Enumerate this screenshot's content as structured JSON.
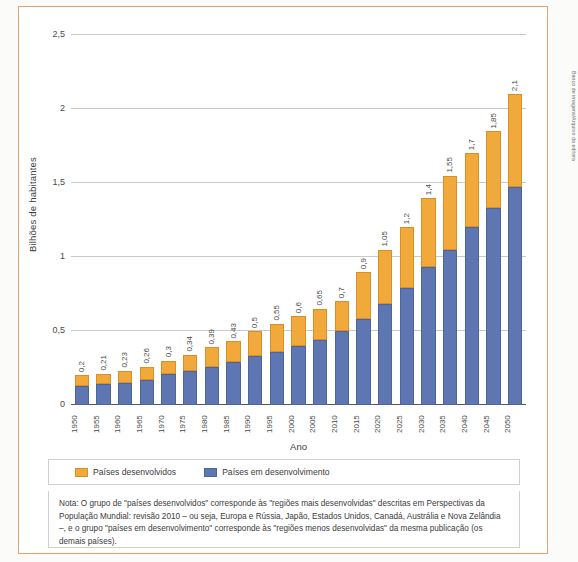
{
  "credit": "Banco de imagens/Arquivo da editora",
  "chart_data": {
    "type": "bar",
    "subtype": "stacked",
    "title": "",
    "xlabel": "Ano",
    "ylabel": "Bilhões de habitantes",
    "ylim": [
      0,
      2.5
    ],
    "yticks": [
      0,
      0.5,
      1,
      1.5,
      2,
      2.5
    ],
    "ytick_labels": [
      "0",
      "0,5",
      "1",
      "1,5",
      "2",
      "2,5"
    ],
    "grid": true,
    "legend_position": "bottom",
    "categories": [
      "1950",
      "1955",
      "1960",
      "1965",
      "1970",
      "1975",
      "1980",
      "1985",
      "1990",
      "1995",
      "2000",
      "2005",
      "2010",
      "2015",
      "2020",
      "2025",
      "2030",
      "2035",
      "2040",
      "2045",
      "2050"
    ],
    "series": [
      {
        "name": "Países em desenvolvimento",
        "color": "#5e77b3",
        "values": [
          0.13,
          0.14,
          0.15,
          0.17,
          0.21,
          0.23,
          0.26,
          0.29,
          0.33,
          0.36,
          0.4,
          0.44,
          0.5,
          0.58,
          0.68,
          0.79,
          0.93,
          1.05,
          1.2,
          1.33,
          1.47
        ]
      },
      {
        "name": "Países desenvolvidos",
        "color": "#f2a93b",
        "values": [
          0.07,
          0.07,
          0.08,
          0.09,
          0.09,
          0.11,
          0.13,
          0.14,
          0.17,
          0.19,
          0.2,
          0.21,
          0.2,
          0.32,
          0.37,
          0.41,
          0.47,
          0.5,
          0.5,
          0.52,
          0.63
        ]
      }
    ],
    "totals": [
      0.2,
      0.21,
      0.23,
      0.26,
      0.3,
      0.34,
      0.39,
      0.43,
      0.5,
      0.55,
      0.6,
      0.65,
      0.7,
      0.9,
      1.05,
      1.2,
      1.4,
      1.55,
      1.7,
      1.85,
      2.1
    ],
    "total_labels": [
      "0,2",
      "0,21",
      "0,23",
      "0,26",
      "0,3",
      "0,34",
      "0,39",
      "0,43",
      "0,5",
      "0,55",
      "0,6",
      "0,65",
      "0,7",
      "0,9",
      "1,05",
      "1,2",
      "1,4",
      "1,55",
      "1,7",
      "1,85",
      "2,1"
    ]
  },
  "legend": {
    "items": [
      {
        "label": "Países desenvolvidos",
        "color": "#f2a93b"
      },
      {
        "label": "Países em desenvolvimento",
        "color": "#5e77b3"
      }
    ]
  },
  "note": {
    "text": "Nota: O grupo de \"países desenvolvidos\" corresponde às \"regiões mais desenvolvidas\" descritas em Perspectivas da População Mundial: revisão 2010 – ou seja, Europa e Rússia, Japão, Estados Unidos, Canadá, Austrália e Nova Zelândia –, e o grupo \"países em desenvolvimento\" corresponde às \"regiões menos desenvolvidas\" da mesma publicação (os demais países)."
  }
}
